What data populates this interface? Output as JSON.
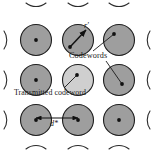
{
  "figure": {
    "type": "diagram",
    "background_color": "#ffffff",
    "width": 154,
    "height": 152
  },
  "colors": {
    "sphere_fill": "#9e9e9e",
    "sphere_fill_highlight": "#cfcfcf",
    "sphere_stroke": "#1f1f1f",
    "line": "#1a1a1a",
    "text": "#1a1a1a",
    "dot": "#111111"
  },
  "labels": {
    "codewords": "Codewords",
    "transmitted_codeword": "Transmitted codeword",
    "min_distance": "d*",
    "received_vector": "r'"
  },
  "spheres": [
    {
      "id": "sphere-top-left",
      "cx": 36,
      "cy": 40,
      "r": 16,
      "fill": "normal",
      "center_dot": true
    },
    {
      "id": "sphere-top-center",
      "cx": 78,
      "cy": 40,
      "r": 16,
      "fill": "normal",
      "center_dot": false
    },
    {
      "id": "sphere-top-right",
      "cx": 119,
      "cy": 40,
      "r": 16,
      "fill": "normal",
      "center_dot": false
    },
    {
      "id": "sphere-mid-left",
      "cx": 36,
      "cy": 80,
      "r": 16,
      "fill": "normal",
      "center_dot": true
    },
    {
      "id": "sphere-mid-center",
      "cx": 78,
      "cy": 80,
      "r": 16,
      "fill": "highlight",
      "center_dot": false
    },
    {
      "id": "sphere-mid-right",
      "cx": 119,
      "cy": 80,
      "r": 16,
      "fill": "normal",
      "center_dot": false
    },
    {
      "id": "sphere-bot-left",
      "cx": 36,
      "cy": 120,
      "r": 16,
      "fill": "normal",
      "center_dot": true
    },
    {
      "id": "sphere-bot-center",
      "cx": 78,
      "cy": 120,
      "r": 16,
      "fill": "normal",
      "center_dot": true
    },
    {
      "id": "sphere-bot-right",
      "cx": 119,
      "cy": 120,
      "r": 16,
      "fill": "normal",
      "center_dot": true
    }
  ],
  "edge_arcs": [
    {
      "id": "arc-top-1",
      "cx": 36,
      "cy": 0,
      "side": "bottom"
    },
    {
      "id": "arc-top-2",
      "cx": 78,
      "cy": 0,
      "side": "bottom"
    },
    {
      "id": "arc-top-3",
      "cx": 119,
      "cy": 0,
      "side": "bottom"
    },
    {
      "id": "arc-bottom-1",
      "cx": 36,
      "cy": 152,
      "side": "top"
    },
    {
      "id": "arc-bottom-2",
      "cx": 78,
      "cy": 152,
      "side": "top"
    },
    {
      "id": "arc-bottom-3",
      "cx": 119,
      "cy": 152,
      "side": "top"
    },
    {
      "id": "arc-left-1",
      "cy": 40,
      "cx": 0,
      "side": "right"
    },
    {
      "id": "arc-left-2",
      "cy": 80,
      "cx": 0,
      "side": "right"
    },
    {
      "id": "arc-left-3",
      "cy": 120,
      "cx": 0,
      "side": "right"
    },
    {
      "id": "arc-right-1",
      "cy": 40,
      "cx": 154,
      "side": "left"
    },
    {
      "id": "arc-right-2",
      "cy": 80,
      "cx": 154,
      "side": "left"
    },
    {
      "id": "arc-right-3",
      "cy": 120,
      "cx": 154,
      "side": "left"
    }
  ],
  "annotations": {
    "received_vector_arrow": {
      "from_x": 70,
      "from_y": 47,
      "to_x": 86,
      "to_y": 29,
      "description": "arrow from sphere center to received point r'"
    },
    "codewords_leader_top": {
      "from_x": 92,
      "from_y": 52,
      "to_x": 117,
      "to_y": 33,
      "description": "leader line from Codewords label to top-right sphere"
    },
    "codewords_leader_bottom": {
      "from_x": 104,
      "from_y": 62,
      "to_x": 123,
      "to_y": 84,
      "description": "leader line from Codewords label to mid-right sphere"
    },
    "transmitted_leader": {
      "from_x": 64,
      "from_y": 88,
      "to_x": 77,
      "to_y": 76,
      "description": "leader line from Transmitted codeword label to center sphere"
    },
    "distance_arrow": {
      "from_x": 36,
      "from_y": 118,
      "to_x": 78,
      "to_y": 118,
      "label": "d*",
      "description": "double-headed arrow showing minimum distance d* between adjacent codeword centers"
    }
  }
}
